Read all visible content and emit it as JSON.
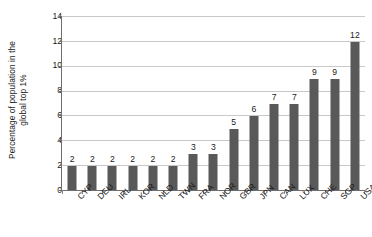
{
  "chart_data": {
    "type": "bar",
    "title": "",
    "subtitle": "",
    "xlabel": "",
    "ylabel": "Percentage of population in the global top 1%",
    "ylabel_lines": [
      "Percentage of population in the",
      "global top 1%"
    ],
    "categories": [
      "CYP",
      "DEU",
      "IRL",
      "KOR",
      "NLD",
      "TWN",
      "FRA",
      "NOR",
      "GBR",
      "JPN",
      "CAN",
      "LUX",
      "CHE",
      "SGP",
      "USA"
    ],
    "values": [
      2,
      2,
      2,
      2,
      2,
      2,
      3,
      3,
      5,
      6,
      7,
      7,
      9,
      9,
      12
    ],
    "data_labels": [
      "2",
      "2",
      "2",
      "2",
      "2",
      "2",
      "3",
      "3",
      "5",
      "6",
      "7",
      "7",
      "9",
      "9",
      "12"
    ],
    "ylim": [
      0,
      14
    ],
    "ytick_values": [
      0,
      2,
      4,
      6,
      8,
      10,
      12,
      14
    ],
    "ytick_labels": [
      "0",
      "2",
      "4",
      "6",
      "8",
      "10",
      "12",
      "14"
    ],
    "grid": true,
    "grid_axis": "y",
    "legend": false,
    "legend_position": "none",
    "bar_color": "#595959",
    "grid_color": "#c9c9c9",
    "axis_color": "#6e6e6e",
    "background_color": "#ffffff",
    "text_color": "#1a1a1a"
  }
}
